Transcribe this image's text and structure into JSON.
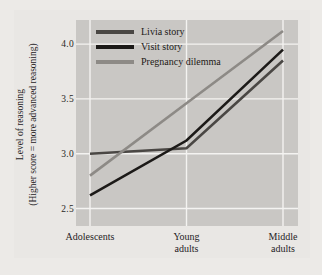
{
  "chart_data": {
    "type": "line",
    "title": "",
    "xlabel": "",
    "ylabel": "Level of reasoning",
    "ylabel_sub": "(Higher score = more advanced reasoning)",
    "categories": [
      "Adolescents",
      "Young adults",
      "Middle adults"
    ],
    "category_lines": [
      [
        "Adolescents"
      ],
      [
        "Young",
        "adults"
      ],
      [
        "Middle",
        "adults"
      ]
    ],
    "yticks": [
      2.5,
      3.0,
      3.5,
      4.0
    ],
    "ytick_labels": [
      "2.5",
      "3.0",
      "3.5",
      "4.0"
    ],
    "ylim": [
      2.34,
      4.22
    ],
    "grid": true,
    "legend_position": "top-center",
    "series": [
      {
        "name": "Livia story",
        "color": "#4a4744",
        "values": [
          3.0,
          3.05,
          3.85
        ]
      },
      {
        "name": "Visit story",
        "color": "#1c1a18",
        "values": [
          2.62,
          3.12,
          3.95
        ]
      },
      {
        "name": "Pregnancy dilemma",
        "color": "#8d8a86",
        "values": [
          2.8,
          3.46,
          4.12
        ]
      }
    ]
  },
  "style": {
    "page_background": "#eceae7",
    "panel_background": "#e9e7e4",
    "plot_background": "#c9c7c4",
    "grid_color": "#f4f3f1",
    "text_color": "#26231f"
  }
}
